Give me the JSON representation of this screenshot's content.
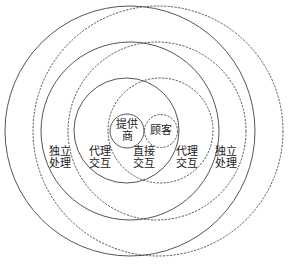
{
  "diagram": {
    "colors": {
      "background": "#ffffff",
      "stroke": "#555555",
      "text": "#222222"
    },
    "circles": {
      "solid": [
        {
          "name": "provider",
          "cx": 127,
          "cy": 131,
          "r": 17
        },
        {
          "name": "inner",
          "cx": 126.5,
          "cy": 130.5,
          "r": 52.5
        },
        {
          "name": "middle",
          "cx": 130,
          "cy": 131,
          "r": 89
        },
        {
          "name": "outer",
          "cx": 130,
          "cy": 131,
          "r": 125
        }
      ],
      "dashed": [
        {
          "name": "customer",
          "cx": 161,
          "cy": 131,
          "r": 16.5
        },
        {
          "name": "inner",
          "cx": 160.5,
          "cy": 130.5,
          "r": 52.5
        },
        {
          "name": "middle",
          "cx": 157,
          "cy": 131,
          "r": 89
        },
        {
          "name": "outer",
          "cx": 158,
          "cy": 131,
          "r": 125
        }
      ]
    },
    "labels": {
      "provider": {
        "line1": "提供",
        "line2": "商"
      },
      "customer": {
        "line1": "顾客"
      },
      "direct_interaction": {
        "line1": "直接",
        "line2": "交互"
      },
      "agent_interaction_left": {
        "line1": "代理",
        "line2": "交互"
      },
      "agent_interaction_right": {
        "line1": "代理",
        "line2": "交互"
      },
      "independent_processing_left": {
        "line1": "独立",
        "line2": "处理"
      },
      "independent_processing_right": {
        "line1": "独立",
        "line2": "处理"
      }
    }
  }
}
